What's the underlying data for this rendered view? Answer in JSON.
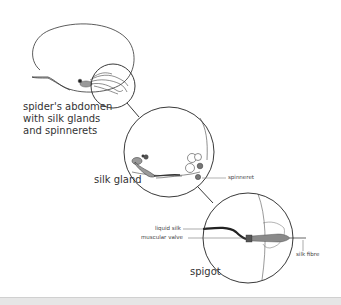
{
  "diagram": {
    "labels": {
      "abdomen": [
        "spider's abdomen",
        "with silk glands",
        "and spinnerets"
      ],
      "silk_gland": "silk gland",
      "spinneret": "spinneret",
      "liquid_silk": "liquid silk",
      "muscular_valve": "muscular valve",
      "spigot": "spigot",
      "silk_fibre": "silk fibre"
    },
    "colors": {
      "outline": "#333333",
      "gland_fill": "#9a9a9a",
      "silk_dark": "#3a3a3a",
      "background": "#ffffff",
      "footer": "#e6e6e6"
    }
  }
}
